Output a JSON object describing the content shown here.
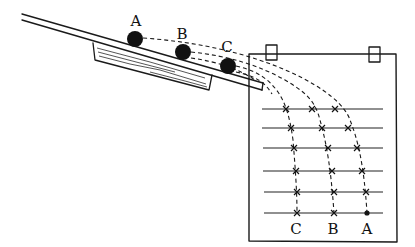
{
  "diagram": {
    "ball_labels": [
      "A",
      "B",
      "C"
    ],
    "trace_labels": [
      "C",
      "B",
      "A"
    ],
    "balls": [
      {
        "label": "A",
        "cx": 135,
        "cy": 39
      },
      {
        "label": "B",
        "cx": 183,
        "cy": 52
      },
      {
        "label": "C",
        "cx": 228,
        "cy": 66
      }
    ],
    "board": {
      "horizontal_lines_y": [
        109,
        128,
        148,
        171,
        192,
        213
      ],
      "clip_count": 2
    },
    "traces": [
      {
        "label": "C",
        "points_x": [
          286,
          291,
          294,
          296,
          297,
          297
        ]
      },
      {
        "label": "B",
        "points_x": [
          312,
          322,
          328,
          332,
          334,
          334
        ]
      },
      {
        "label": "A",
        "points_x": [
          335,
          348,
          357,
          362,
          366,
          367
        ]
      }
    ],
    "colors": {
      "ink": "#1a1a1a",
      "background": "#ffffff"
    }
  }
}
